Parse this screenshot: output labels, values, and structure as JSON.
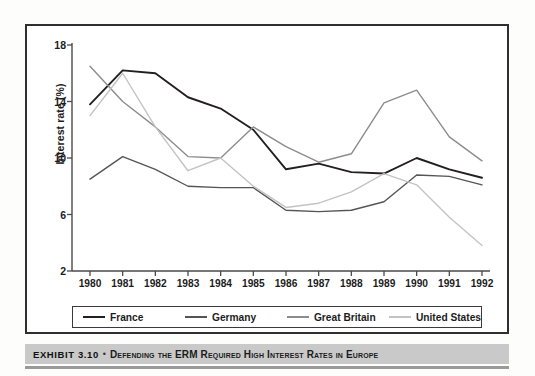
{
  "caption": {
    "exhibit_label": "EXHIBIT 3.10",
    "separator": "•",
    "title": "Defending the ERM Required High Interest Rates in Europe"
  },
  "chart_data": {
    "type": "line",
    "title": "",
    "xlabel": "",
    "ylabel": "Interest rate (%)",
    "categories": [
      "1980",
      "1981",
      "1982",
      "1983",
      "1984",
      "1985",
      "1986",
      "1987",
      "1988",
      "1989",
      "1990",
      "1991",
      "1992"
    ],
    "xlim": [
      1980,
      1992
    ],
    "ylim": [
      2,
      18
    ],
    "yticks": [
      2,
      6,
      10,
      14,
      18
    ],
    "grid": false,
    "legend_position": "bottom",
    "series": [
      {
        "name": "France",
        "color": "#231f20",
        "values": [
          13.8,
          16.2,
          16.0,
          14.3,
          13.5,
          12.0,
          9.2,
          9.6,
          9.0,
          8.9,
          10.0,
          9.2,
          8.6
        ]
      },
      {
        "name": "Germany",
        "color": "#555555",
        "values": [
          8.5,
          10.1,
          9.2,
          8.0,
          7.9,
          7.9,
          6.3,
          6.2,
          6.3,
          6.9,
          8.8,
          8.7,
          8.1
        ]
      },
      {
        "name": "Great Britain",
        "color": "#8c8c8c",
        "values": [
          16.5,
          14.0,
          12.2,
          10.1,
          10.0,
          12.2,
          10.8,
          9.7,
          10.3,
          13.9,
          14.8,
          11.5,
          9.8
        ]
      },
      {
        "name": "United States",
        "color": "#c3c3c3",
        "values": [
          13.0,
          16.0,
          12.2,
          9.1,
          10.0,
          8.0,
          6.5,
          6.8,
          7.6,
          8.9,
          8.1,
          5.8,
          3.8
        ]
      }
    ]
  }
}
